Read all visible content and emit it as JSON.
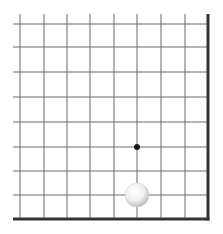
{
  "board": {
    "description": "Go board lower-right corner",
    "background": "#ffffff",
    "line_color": "#6a6a6a",
    "edge_color": "#333333",
    "vertical_lines_x": [
      20,
      44,
      67,
      90,
      114,
      137,
      161,
      185
    ],
    "horizontal_lines_y": [
      24,
      47,
      72,
      97,
      122,
      147,
      171,
      195
    ],
    "right_edge_x": 208,
    "bottom_edge_y": 219,
    "line_extent": {
      "left": 13,
      "top": 14
    },
    "star_points": [
      {
        "x": 137,
        "y": 147,
        "r": 3
      }
    ],
    "stones": [
      {
        "color": "white",
        "x": 137,
        "y": 195,
        "r": 12
      }
    ]
  }
}
